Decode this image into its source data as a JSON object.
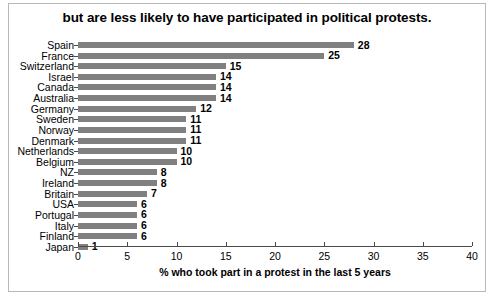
{
  "chart_data": {
    "type": "bar",
    "orientation": "horizontal",
    "title": "but are less likely to have participated in political protests.",
    "xlabel": "% who took part in a protest in the last 5 years",
    "ylabel": "",
    "xlim": [
      0,
      40
    ],
    "xticks": [
      0,
      5,
      10,
      15,
      20,
      25,
      30,
      35,
      40
    ],
    "xtick_labels": [
      "0",
      "5",
      "10",
      "15",
      "20",
      "25",
      "30",
      "35",
      "40"
    ],
    "grid": false,
    "legend": false,
    "bar_color": "#808080",
    "categories": [
      "Spain",
      "France",
      "Switzerland",
      "Israel",
      "Canada",
      "Australia",
      "Germany",
      "Sweden",
      "Norway",
      "Denmark",
      "Netherlands",
      "Belgium",
      "NZ",
      "Ireland",
      "Britain",
      "USA",
      "Portugal",
      "Italy",
      "Finland",
      "Japan"
    ],
    "values": [
      28,
      25,
      15,
      14,
      14,
      14,
      12,
      11,
      11,
      11,
      10,
      10,
      8,
      8,
      7,
      6,
      6,
      6,
      6,
      1
    ],
    "data_labels": [
      "28",
      "25",
      "15",
      "14",
      "14",
      "14",
      "12",
      "11",
      "11",
      "11",
      "10",
      "10",
      "8",
      "8",
      "7",
      "6",
      "6",
      "6",
      "6",
      "1"
    ]
  }
}
